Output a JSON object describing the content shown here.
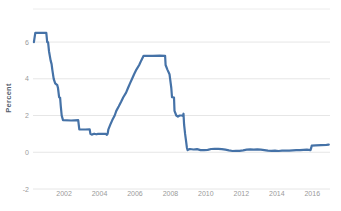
{
  "chart_data": {
    "type": "line",
    "title": "",
    "xlabel": "",
    "ylabel": "Percent",
    "grid": true,
    "legend": "none",
    "x_ticks": [
      {
        "label": "2002",
        "value": 2002
      },
      {
        "label": "2004",
        "value": 2004
      },
      {
        "label": "2006",
        "value": 2006
      },
      {
        "label": "2008",
        "value": 2008
      },
      {
        "label": "2010",
        "value": 2010
      },
      {
        "label": "2012",
        "value": 2012
      },
      {
        "label": "2014",
        "value": 2014
      },
      {
        "label": "2016",
        "value": 2016
      }
    ],
    "y_ticks": [
      {
        "label": "6",
        "value": 6
      },
      {
        "label": "4",
        "value": 4
      },
      {
        "label": "2",
        "value": 2
      },
      {
        "label": "0",
        "value": 0
      },
      {
        "label": "-2",
        "value": -2
      }
    ],
    "xlim": [
      2000.25,
      2017.0
    ],
    "ylim": [
      -2,
      7.8
    ],
    "series": [
      {
        "name": "effective-federal-funds-rate",
        "color": "#4572a7",
        "points": [
          [
            2000.3,
            6.0
          ],
          [
            2000.38,
            6.5
          ],
          [
            2001.0,
            6.5
          ],
          [
            2001.05,
            6.0
          ],
          [
            2001.1,
            5.98
          ],
          [
            2001.15,
            5.5
          ],
          [
            2001.24,
            5.0
          ],
          [
            2001.3,
            4.8
          ],
          [
            2001.34,
            4.5
          ],
          [
            2001.42,
            4.0
          ],
          [
            2001.5,
            3.75
          ],
          [
            2001.62,
            3.65
          ],
          [
            2001.66,
            3.5
          ],
          [
            2001.72,
            3.0
          ],
          [
            2001.78,
            2.97
          ],
          [
            2001.82,
            2.5
          ],
          [
            2001.87,
            2.0
          ],
          [
            2001.94,
            1.75
          ],
          [
            2002.4,
            1.73
          ],
          [
            2002.8,
            1.75
          ],
          [
            2002.86,
            1.25
          ],
          [
            2003.2,
            1.24
          ],
          [
            2003.45,
            1.25
          ],
          [
            2003.49,
            1.0
          ],
          [
            2003.56,
            0.96
          ],
          [
            2003.7,
            1.01
          ],
          [
            2003.82,
            0.98
          ],
          [
            2003.92,
            1.0
          ],
          [
            2004.35,
            1.0
          ],
          [
            2004.42,
            0.95
          ],
          [
            2004.46,
            1.0
          ],
          [
            2004.5,
            1.25
          ],
          [
            2004.61,
            1.5
          ],
          [
            2004.72,
            1.75
          ],
          [
            2004.86,
            2.0
          ],
          [
            2004.95,
            2.25
          ],
          [
            2005.09,
            2.5
          ],
          [
            2005.22,
            2.75
          ],
          [
            2005.34,
            3.0
          ],
          [
            2005.5,
            3.25
          ],
          [
            2005.61,
            3.5
          ],
          [
            2005.72,
            3.75
          ],
          [
            2005.84,
            4.0
          ],
          [
            2005.95,
            4.25
          ],
          [
            2006.08,
            4.5
          ],
          [
            2006.24,
            4.75
          ],
          [
            2006.36,
            5.0
          ],
          [
            2006.49,
            5.25
          ],
          [
            2007.0,
            5.25
          ],
          [
            2007.4,
            5.26
          ],
          [
            2007.7,
            5.25
          ],
          [
            2007.73,
            4.75
          ],
          [
            2007.83,
            4.5
          ],
          [
            2007.95,
            4.25
          ],
          [
            2008.05,
            3.5
          ],
          [
            2008.09,
            3.0
          ],
          [
            2008.2,
            2.98
          ],
          [
            2008.23,
            2.25
          ],
          [
            2008.33,
            2.0
          ],
          [
            2008.42,
            1.94
          ],
          [
            2008.52,
            2.0
          ],
          [
            2008.65,
            2.0
          ],
          [
            2008.71,
            1.98
          ],
          [
            2008.74,
            2.1
          ],
          [
            2008.77,
            1.5
          ],
          [
            2008.83,
            1.0
          ],
          [
            2008.89,
            0.55
          ],
          [
            2008.93,
            0.25
          ],
          [
            2008.97,
            0.12
          ],
          [
            2009.1,
            0.18
          ],
          [
            2009.3,
            0.15
          ],
          [
            2009.5,
            0.17
          ],
          [
            2009.7,
            0.12
          ],
          [
            2009.9,
            0.12
          ],
          [
            2010.1,
            0.13
          ],
          [
            2010.3,
            0.18
          ],
          [
            2010.5,
            0.19
          ],
          [
            2010.7,
            0.19
          ],
          [
            2010.9,
            0.17
          ],
          [
            2011.1,
            0.14
          ],
          [
            2011.3,
            0.1
          ],
          [
            2011.5,
            0.07
          ],
          [
            2011.7,
            0.08
          ],
          [
            2011.9,
            0.08
          ],
          [
            2012.1,
            0.1
          ],
          [
            2012.3,
            0.14
          ],
          [
            2012.5,
            0.16
          ],
          [
            2012.7,
            0.14
          ],
          [
            2012.9,
            0.16
          ],
          [
            2013.1,
            0.14
          ],
          [
            2013.3,
            0.12
          ],
          [
            2013.5,
            0.09
          ],
          [
            2013.7,
            0.08
          ],
          [
            2013.9,
            0.09
          ],
          [
            2014.1,
            0.07
          ],
          [
            2014.3,
            0.09
          ],
          [
            2014.5,
            0.09
          ],
          [
            2014.7,
            0.09
          ],
          [
            2014.9,
            0.1
          ],
          [
            2015.1,
            0.11
          ],
          [
            2015.3,
            0.12
          ],
          [
            2015.5,
            0.13
          ],
          [
            2015.7,
            0.14
          ],
          [
            2015.9,
            0.12
          ],
          [
            2015.94,
            0.24
          ],
          [
            2015.97,
            0.36
          ],
          [
            2016.2,
            0.38
          ],
          [
            2016.5,
            0.39
          ],
          [
            2016.8,
            0.4
          ],
          [
            2016.93,
            0.41
          ]
        ]
      }
    ],
    "layout": {
      "plot_left": 33,
      "plot_right": 330,
      "plot_top": 9,
      "plot_bottom": 189,
      "x_tick_label_y": 196,
      "y_tick_label_x": 29,
      "ylabel_x": 11,
      "ylabel_y": 98
    }
  },
  "colors": {
    "background": "#ffffff",
    "grid": "#e6e6e6",
    "top_border": "#ececec",
    "tick_label": "#9a9a9a",
    "axis_title": "#55606e",
    "line": "#4572a7"
  }
}
